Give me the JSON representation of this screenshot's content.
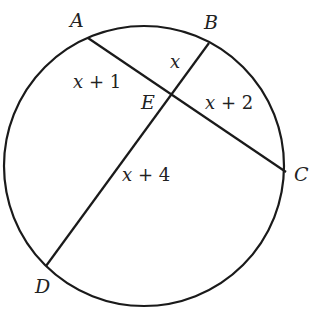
{
  "diagram": {
    "type": "circle with two intersecting chords",
    "stroke_color": "#1a1a1a",
    "circle": {
      "cx": 144,
      "cy": 166,
      "r": 140
    },
    "points": [
      {
        "name": "A",
        "x": 88,
        "y": 38
      },
      {
        "name": "B",
        "x": 209,
        "y": 43
      },
      {
        "name": "C",
        "x": 286,
        "y": 172
      },
      {
        "name": "D",
        "x": 46,
        "y": 266
      },
      {
        "name": "E",
        "x": 171,
        "y": 96
      }
    ],
    "chords": [
      "AC",
      "BD"
    ],
    "segment_labels": {
      "AE": {
        "var": "x",
        "rest": " + 1"
      },
      "BE": {
        "var": "x",
        "rest": ""
      },
      "EC": {
        "var": "x",
        "rest": " + 2"
      },
      "ED": {
        "var": "x",
        "rest": " + 4"
      }
    }
  }
}
